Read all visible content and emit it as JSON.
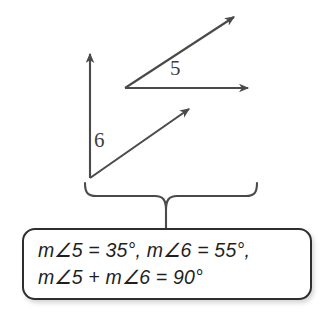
{
  "figure": {
    "type": "geometry-angle-diagram",
    "stroke_color": "#4a4a4a",
    "background_color": "#ffffff",
    "angles": [
      {
        "name": "angle-5",
        "label": "5",
        "label_position": {
          "x": 170,
          "y": 58
        },
        "vertex": {
          "x": 125,
          "y": 88
        },
        "rays": [
          {
            "name": "horizontal-ray",
            "from": {
              "x": 125,
              "y": 88
            },
            "to": {
              "x": 250,
              "y": 88
            },
            "arrowhead": "end"
          },
          {
            "name": "diagonal-ray",
            "from": {
              "x": 125,
              "y": 88
            },
            "to": {
              "x": 236,
              "y": 16
            },
            "arrowhead": "end"
          }
        ]
      },
      {
        "name": "angle-6",
        "label": "6",
        "label_position": {
          "x": 94,
          "y": 130
        },
        "vertex": {
          "x": 90,
          "y": 178
        },
        "rays": [
          {
            "name": "vertical-ray",
            "from": {
              "x": 90,
              "y": 178
            },
            "to": {
              "x": 90,
              "y": 52
            },
            "arrowhead": "end"
          },
          {
            "name": "diagonal-ray",
            "from": {
              "x": 90,
              "y": 178
            },
            "to": {
              "x": 191,
              "y": 107
            },
            "arrowhead": "end"
          }
        ]
      }
    ],
    "brace": {
      "name": "curly-brace",
      "left_x": 85,
      "right_x": 257,
      "top_y": 183,
      "center_x": 166,
      "stem_bottom_y": 228
    }
  },
  "callout": {
    "name": "equation-callout",
    "border_color": "#2e2e2e",
    "lines": [
      "m∠5 = 35°, m∠6 = 55°,",
      "m∠5 +  m∠6 = 90°"
    ],
    "values": {
      "angle_5_measure": "35°",
      "angle_6_measure": "55°",
      "sum_measure": "90°"
    }
  }
}
